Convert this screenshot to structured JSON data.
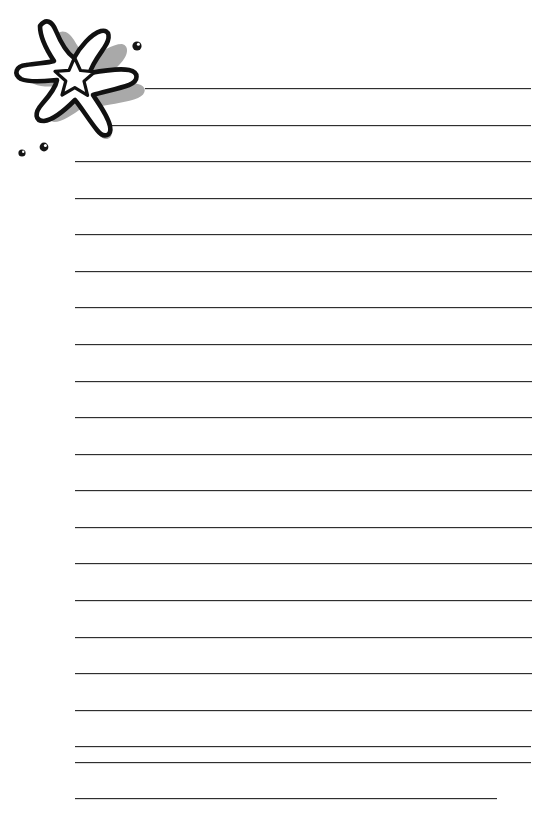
{
  "page": {
    "title": "Lined Stationery Page",
    "kind": "blank-ruled-writing-paper",
    "width": 559,
    "height": 820,
    "background_color": "#ffffff"
  },
  "artwork": {
    "name": "starfish-decoration",
    "description": "Hand-drawn six-armed starfish with a small white star in its center, a soft gray shadow blob behind it, and three small round bubbles nearby",
    "outline_color": "#111111",
    "shadow_color": "#a9a9a9",
    "fill_color": "#ffffff",
    "bubble_color": "#141414",
    "bubbles": [
      {
        "name": "bubble-top-right",
        "cx": 137,
        "cy": 46,
        "r": 4.6
      },
      {
        "name": "bubble-lower-right",
        "cx": 44,
        "cy": 147,
        "r": 4.4
      },
      {
        "name": "bubble-lower-left",
        "cx": 22,
        "cy": 153,
        "r": 3.6
      }
    ]
  },
  "ruled_lines": {
    "count": 21,
    "color": "#2f2f2f",
    "thickness_px": 1,
    "spacing_px": 36.6,
    "default_left_px": 75,
    "default_right_px": 532,
    "lines": [
      {
        "index": 1,
        "y": 88,
        "left": 145,
        "right": 531
      },
      {
        "index": 2,
        "y": 125,
        "left": 112,
        "right": 531
      },
      {
        "index": 3,
        "y": 161,
        "left": 75,
        "right": 531
      },
      {
        "index": 4,
        "y": 198,
        "left": 75,
        "right": 532
      },
      {
        "index": 5,
        "y": 234,
        "left": 75,
        "right": 532
      },
      {
        "index": 6,
        "y": 271,
        "left": 75,
        "right": 532
      },
      {
        "index": 7,
        "y": 307,
        "left": 75,
        "right": 532
      },
      {
        "index": 8,
        "y": 344,
        "left": 75,
        "right": 532
      },
      {
        "index": 9,
        "y": 381,
        "left": 75,
        "right": 532
      },
      {
        "index": 10,
        "y": 417,
        "left": 75,
        "right": 532
      },
      {
        "index": 11,
        "y": 454,
        "left": 75,
        "right": 532
      },
      {
        "index": 12,
        "y": 490,
        "left": 75,
        "right": 532
      },
      {
        "index": 13,
        "y": 527,
        "left": 75,
        "right": 532
      },
      {
        "index": 14,
        "y": 563,
        "left": 75,
        "right": 532
      },
      {
        "index": 15,
        "y": 600,
        "left": 75,
        "right": 532
      },
      {
        "index": 16,
        "y": 637,
        "left": 75,
        "right": 532
      },
      {
        "index": 17,
        "y": 673,
        "left": 75,
        "right": 532
      },
      {
        "index": 18,
        "y": 710,
        "left": 75,
        "right": 532
      },
      {
        "index": 19,
        "y": 746,
        "left": 75,
        "right": 531
      },
      {
        "index": 20,
        "y": 762,
        "left": 75,
        "right": 531
      },
      {
        "index": 21,
        "y": 798,
        "left": 75,
        "right": 497
      }
    ]
  }
}
